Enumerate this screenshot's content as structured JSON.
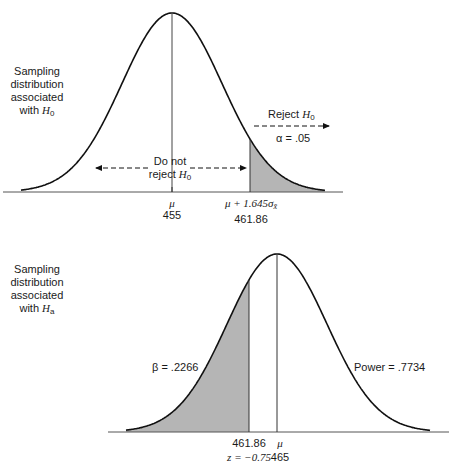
{
  "top_panel": {
    "side_label": [
      "Sampling",
      "distribution",
      "associated",
      "with "
    ],
    "side_label_hyp": "H",
    "side_label_sub": "0",
    "reject_label": "Reject ",
    "reject_h": "H",
    "reject_sub": "0",
    "alpha_label": "α = .05",
    "do_not_line1": "Do not",
    "do_not_line2": "reject ",
    "do_not_h": "H",
    "do_not_sub": "0",
    "mu_symbol": "μ",
    "mu_value": "455",
    "critical_expr": "μ + 1.645σ",
    "critical_sub": "x̄",
    "critical_value": "461.86"
  },
  "bottom_panel": {
    "side_label": [
      "Sampling",
      "distribution",
      "associated",
      "with "
    ],
    "side_label_hyp": "H",
    "side_label_sub": "a",
    "beta_label": "β = .2266",
    "power_label": "Power = .7734",
    "critical_value": "461.86",
    "z_label": "z = −0.75",
    "mu_symbol": "μ",
    "mu_value": "465"
  },
  "colors": {
    "shade": "#b5b5b5",
    "line": "#111111",
    "axis": "#555555"
  },
  "chart_data": [
    {
      "type": "area",
      "title": "Sampling distribution associated with H0",
      "distribution": "normal",
      "mean": 455,
      "critical_value": 461.86,
      "critical_expr": "μ + 1.645σ_x̄",
      "shaded_region": "right tail (x > 461.86)",
      "annotations": [
        "Reject H0",
        "α = .05",
        "Do not reject H0"
      ],
      "alpha": 0.05
    },
    {
      "type": "area",
      "title": "Sampling distribution associated with Ha",
      "distribution": "normal",
      "mean": 465,
      "critical_value": 461.86,
      "z_at_critical": -0.75,
      "shaded_region": "left tail (x < 461.86)",
      "annotations": [
        "β = .2266",
        "Power = .7734"
      ],
      "beta": 0.2266,
      "power": 0.7734
    }
  ]
}
